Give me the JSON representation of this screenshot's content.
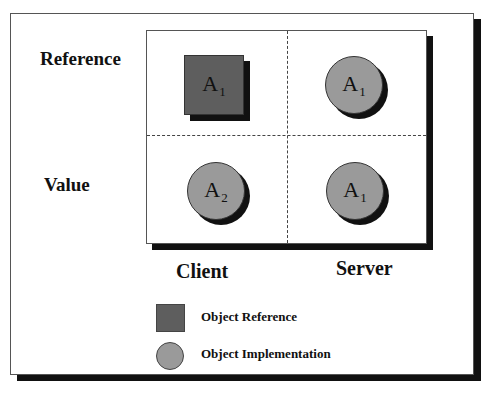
{
  "diagram": {
    "row_labels": [
      "Reference",
      "Value"
    ],
    "column_labels": [
      "Client",
      "Server"
    ],
    "cells": [
      {
        "row": "Reference",
        "column": "Client",
        "shape": "square",
        "name": "A",
        "subscript": "1"
      },
      {
        "row": "Reference",
        "column": "Server",
        "shape": "circle",
        "name": "A",
        "subscript": "1"
      },
      {
        "row": "Value",
        "column": "Client",
        "shape": "circle",
        "name": "A",
        "subscript": "2"
      },
      {
        "row": "Value",
        "column": "Server",
        "shape": "circle",
        "name": "A",
        "subscript": "1"
      }
    ],
    "legend": [
      {
        "shape": "square",
        "label": "Object Reference"
      },
      {
        "shape": "circle",
        "label": "Object Implementation"
      }
    ],
    "colors": {
      "reference_fill": "#5e5e5e",
      "implementation_fill": "#9a9a9a",
      "shadow": "#111111"
    }
  }
}
